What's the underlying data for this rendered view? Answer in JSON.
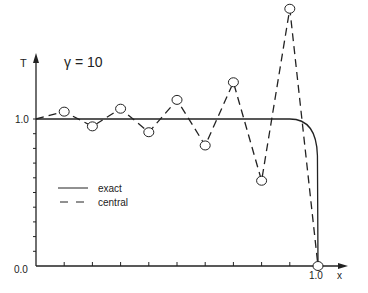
{
  "chart_data": {
    "type": "line",
    "title": "γ = 10",
    "xlabel": "x",
    "ylabel": "T",
    "xlim": [
      0.0,
      1.0
    ],
    "ylim": [
      0.0,
      1.8
    ],
    "x_tick_labels": [
      "0.0",
      "1.0"
    ],
    "y_tick_labels": [
      "0.0",
      "1.0"
    ],
    "grid": false,
    "legend_position": "lower left",
    "series": [
      {
        "name": "exact",
        "style": "solid",
        "x": [
          0.0,
          0.9,
          0.94,
          0.97,
          0.99,
          1.0
        ],
        "y": [
          1.0,
          1.0,
          0.998,
          0.95,
          0.7,
          0.0
        ]
      },
      {
        "name": "central",
        "style": "dashed",
        "markers": "open-circle",
        "x": [
          0.0,
          0.1,
          0.2,
          0.3,
          0.4,
          0.5,
          0.6,
          0.7,
          0.8,
          0.9,
          1.0
        ],
        "y": [
          1.0,
          1.05,
          0.95,
          1.07,
          0.91,
          1.13,
          0.82,
          1.25,
          0.58,
          1.75,
          0.0
        ]
      }
    ]
  },
  "labels": {
    "title": "γ = 10",
    "y_axis": "T",
    "x_axis": "x",
    "y_tick_top": "1.0",
    "origin": "0.0",
    "x_tick_end": "1.0",
    "legend_exact": "exact",
    "legend_central": "central"
  }
}
